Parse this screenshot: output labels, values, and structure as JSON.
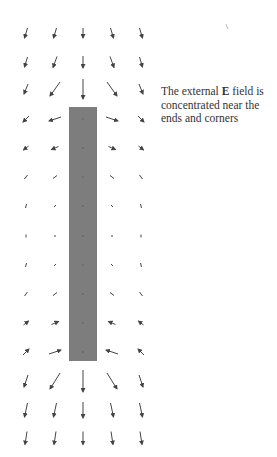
{
  "diagram": {
    "caption": {
      "before": "The external ",
      "symbol": "E",
      "after": "  field is concentrated near the ends and corners"
    },
    "bar": {
      "x": 69,
      "y": 107,
      "width": 28,
      "height": 254,
      "fill": "#7d7d7d"
    },
    "arrow_color": "#444444",
    "grid": {
      "columns_x": [
        26,
        55,
        83,
        112,
        141
      ],
      "rows_y": [
        33,
        62,
        89,
        119,
        148,
        177,
        206,
        236,
        265,
        294,
        323,
        352,
        381,
        410,
        438
      ]
    },
    "arrows": [
      {
        "row": 0,
        "dirs": [
          [
            -3,
            10
          ],
          [
            -3,
            10
          ],
          [
            0,
            10
          ],
          [
            3,
            10
          ],
          [
            3,
            10
          ]
        ]
      },
      {
        "row": 1,
        "dirs": [
          [
            -3,
            10
          ],
          [
            -4,
            11
          ],
          [
            0,
            12
          ],
          [
            4,
            11
          ],
          [
            3,
            10
          ]
        ]
      },
      {
        "row": 2,
        "dirs": [
          [
            -4,
            10
          ],
          [
            -10,
            14
          ],
          [
            0,
            20
          ],
          [
            10,
            14
          ],
          [
            4,
            10
          ]
        ]
      },
      {
        "row": 3,
        "dirs": [
          [
            -6,
            6
          ],
          [
            -12,
            4
          ],
          [
            0,
            0
          ],
          [
            12,
            4
          ],
          [
            6,
            6
          ]
        ]
      },
      {
        "row": 4,
        "dirs": [
          [
            -5,
            4
          ],
          [
            -7,
            3
          ],
          [
            0,
            0
          ],
          [
            7,
            3
          ],
          [
            5,
            4
          ]
        ]
      },
      {
        "row": 5,
        "dirs": [
          [
            -3,
            4
          ],
          [
            -4,
            3
          ],
          [
            0,
            0
          ],
          [
            4,
            3
          ],
          [
            3,
            4
          ]
        ]
      },
      {
        "row": 6,
        "dirs": [
          [
            -1,
            4
          ],
          [
            -2,
            2
          ],
          [
            0,
            0
          ],
          [
            2,
            2
          ],
          [
            1,
            4
          ]
        ]
      },
      {
        "row": 7,
        "dirs": [
          [
            0,
            3
          ],
          [
            0,
            2
          ],
          [
            0,
            0
          ],
          [
            0,
            2
          ],
          [
            0,
            3
          ]
        ]
      },
      {
        "row": 8,
        "dirs": [
          [
            1,
            -4
          ],
          [
            2,
            -2
          ],
          [
            0,
            0
          ],
          [
            -2,
            -2
          ],
          [
            -1,
            -4
          ]
        ]
      },
      {
        "row": 9,
        "dirs": [
          [
            3,
            -4
          ],
          [
            4,
            -3
          ],
          [
            0,
            0
          ],
          [
            -4,
            -3
          ],
          [
            -3,
            -4
          ]
        ]
      },
      {
        "row": 10,
        "dirs": [
          [
            5,
            -4
          ],
          [
            7,
            -3
          ],
          [
            0,
            0
          ],
          [
            -7,
            -3
          ],
          [
            -5,
            -4
          ]
        ]
      },
      {
        "row": 11,
        "dirs": [
          [
            6,
            -6
          ],
          [
            12,
            -4
          ],
          [
            0,
            0
          ],
          [
            -12,
            -4
          ],
          [
            -6,
            -6
          ]
        ]
      },
      {
        "row": 12,
        "dirs": [
          [
            -4,
            12
          ],
          [
            -10,
            16
          ],
          [
            0,
            22
          ],
          [
            10,
            16
          ],
          [
            4,
            12
          ]
        ]
      },
      {
        "row": 13,
        "dirs": [
          [
            -3,
            14
          ],
          [
            -3,
            14
          ],
          [
            0,
            16
          ],
          [
            3,
            14
          ],
          [
            3,
            14
          ]
        ]
      },
      {
        "row": 14,
        "dirs": [
          [
            -2,
            13
          ],
          [
            -2,
            13
          ],
          [
            0,
            13
          ],
          [
            2,
            13
          ],
          [
            2,
            13
          ]
        ]
      }
    ]
  }
}
